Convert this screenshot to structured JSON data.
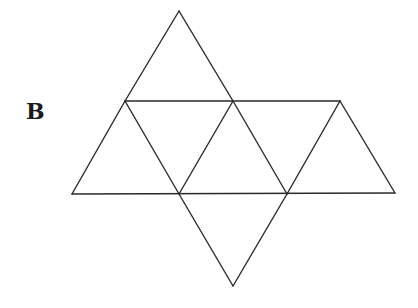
{
  "figure": {
    "label": "B",
    "stroke_color": "#2a2a2a",
    "vertices": {
      "top": [
        179,
        11
      ],
      "mid_left": [
        125,
        101
      ],
      "mid_center": [
        233,
        101
      ],
      "mid_right": [
        340,
        101
      ],
      "bot_left": [
        72,
        194
      ],
      "bot_center_left": [
        179,
        194
      ],
      "bot_center_right": [
        287,
        194
      ],
      "bot_right": [
        395,
        193
      ],
      "bottom": [
        233,
        286
      ]
    },
    "triangle_count": 8
  }
}
